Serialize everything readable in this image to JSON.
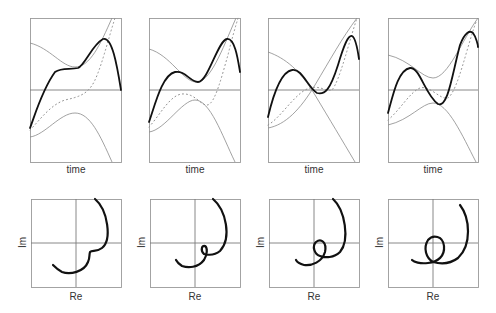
{
  "figure": {
    "time_label": "time",
    "re_label": "Re",
    "im_label": "Im",
    "colors": {
      "main_curve": "#111111",
      "envelope": "#8a8a8a",
      "dotted": "#8f8f8f",
      "frame": "#9a9a9a"
    },
    "top_panels": [
      {
        "id": 1,
        "xlabel": "time",
        "description": "envelope curves separated; main curve with plateau"
      },
      {
        "id": 2,
        "xlabel": "time",
        "description": "envelopes approach; main curve small wiggle"
      },
      {
        "id": 3,
        "xlabel": "time",
        "description": "envelopes cross; main curve crosses zero"
      },
      {
        "id": 4,
        "xlabel": "time",
        "description": "envelopes pinch; main curve larger oscillation"
      }
    ],
    "bottom_panels": [
      {
        "id": 1,
        "xlabel": "Re",
        "ylabel": "Im",
        "description": "cusp"
      },
      {
        "id": 2,
        "xlabel": "Re",
        "ylabel": "Im",
        "description": "small loop"
      },
      {
        "id": 3,
        "xlabel": "Re",
        "ylabel": "Im",
        "description": "medium loop"
      },
      {
        "id": 4,
        "xlabel": "Re",
        "ylabel": "Im",
        "description": "large loop"
      }
    ]
  }
}
